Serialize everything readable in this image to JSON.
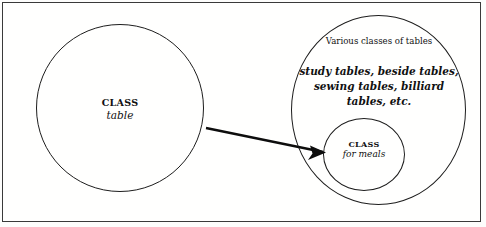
{
  "diagram": {
    "frame": {
      "name": "outer-border"
    },
    "left_circle": {
      "keyword": "CLASS",
      "name": "table"
    },
    "right_circle": {
      "caption": "Various classes of tables",
      "examples_line1": "study tables, beside tables,",
      "examples_line2": "sewing tables, billiard tables, etc."
    },
    "inner_circle": {
      "keyword": "CLASS",
      "name": "for meals"
    },
    "arrow": {
      "label": "",
      "color": "#0d0d0d"
    }
  }
}
